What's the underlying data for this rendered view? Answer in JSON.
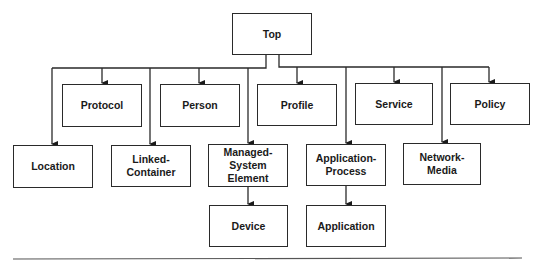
{
  "diagram": {
    "type": "hierarchy",
    "nodes": {
      "top": "Top",
      "protocol": "Protocol",
      "person": "Person",
      "profile": "Profile",
      "service": "Service",
      "policy": "Policy",
      "location": "Location",
      "linked_container": "Linked-\nContainer",
      "managed_system_element": "Managed-\nSystem\nElement",
      "application_process": "Application-\nProcess",
      "network_media": "Network-\nMedia",
      "device": "Device",
      "application": "Application"
    },
    "edges": [
      [
        "Top",
        "Location"
      ],
      [
        "Top",
        "Protocol"
      ],
      [
        "Top",
        "Linked-Container"
      ],
      [
        "Top",
        "Person"
      ],
      [
        "Top",
        "Managed-System Element"
      ],
      [
        "Top",
        "Profile"
      ],
      [
        "Top",
        "Application-Process"
      ],
      [
        "Top",
        "Service"
      ],
      [
        "Top",
        "Network-Media"
      ],
      [
        "Top",
        "Policy"
      ],
      [
        "Managed-System Element",
        "Device"
      ],
      [
        "Application-Process",
        "Application"
      ]
    ]
  }
}
